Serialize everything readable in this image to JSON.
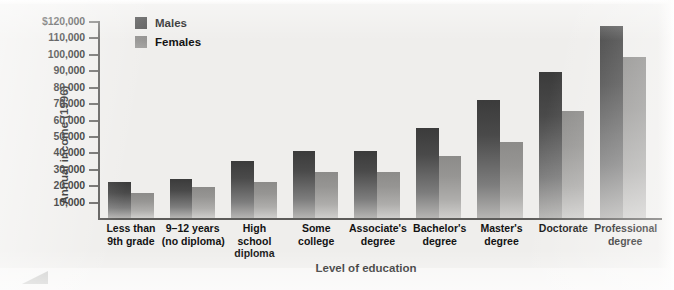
{
  "chart_data": {
    "type": "bar",
    "title": "",
    "xlabel": "Level of education",
    "ylabel": "Annual income (1996)",
    "categories": [
      "Less than\n9th grade",
      "9–12 years\n(no diploma)",
      "High\nschool\ndiploma",
      "Some\ncollege",
      "Associate's\ndegree",
      "Bachelor's\ndegree",
      "Master's\ndegree",
      "Doctorate",
      "Professional\ndegree"
    ],
    "category_lines": [
      [
        "Less than",
        "9th grade"
      ],
      [
        "9–12 years",
        "(no diploma)"
      ],
      [
        "High",
        "school",
        "diploma"
      ],
      [
        "Some",
        "college"
      ],
      [
        "Associate's",
        "degree"
      ],
      [
        "Bachelor's",
        "degree"
      ],
      [
        "Master's",
        "degree"
      ],
      [
        "Doctorate"
      ],
      [
        "Professional",
        "degree"
      ]
    ],
    "series": [
      {
        "name": "Males",
        "color": "#3b3b3b",
        "values": [
          22000,
          24000,
          35000,
          41000,
          41000,
          55000,
          72000,
          89000,
          117000
        ]
      },
      {
        "name": "Females",
        "color": "#8c8b89",
        "values": [
          15000,
          19000,
          22000,
          28000,
          28000,
          38000,
          46000,
          65000,
          98000
        ]
      }
    ],
    "ylim": [
      0,
      120000
    ],
    "ytick_values": [
      10000,
      20000,
      30000,
      40000,
      50000,
      60000,
      70000,
      80000,
      90000,
      100000,
      110000,
      120000
    ],
    "ytick_labels": [
      "10,000",
      "20,000",
      "30,000",
      "40,000",
      "50,000",
      "60,000",
      "70,000",
      "80,000",
      "90,000",
      "100,000",
      "110,000",
      "$120,000"
    ],
    "grid": false,
    "legend_position": "top-left-inside"
  },
  "legend": {
    "items": [
      {
        "label": "Males"
      },
      {
        "label": "Females"
      }
    ]
  },
  "colors": {
    "background": "#efeeec",
    "axis": "#5d5c5a",
    "text": "#131313",
    "male_bar": "#3b3b3b",
    "female_bar": "#8c8b89"
  }
}
